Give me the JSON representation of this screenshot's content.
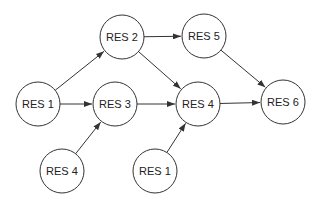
{
  "diagram": {
    "type": "directed-graph",
    "node_radius": 22,
    "colors": {
      "stroke": "#333333",
      "fill": "#ffffff",
      "text": "#222222"
    },
    "nodes": [
      {
        "id": "n_res1_left",
        "label": "RES 1",
        "x": 38,
        "y": 104
      },
      {
        "id": "n_res2",
        "label": "RES 2",
        "x": 122,
        "y": 37
      },
      {
        "id": "n_res3",
        "label": "RES 3",
        "x": 115,
        "y": 104
      },
      {
        "id": "n_res4_mid",
        "label": "RES 4",
        "x": 198,
        "y": 104
      },
      {
        "id": "n_res5",
        "label": "RES 5",
        "x": 204,
        "y": 36
      },
      {
        "id": "n_res6",
        "label": "RES 6",
        "x": 283,
        "y": 102
      },
      {
        "id": "n_res4_bottom",
        "label": "RES 4",
        "x": 62,
        "y": 171
      },
      {
        "id": "n_res1_bottom",
        "label": "RES 1",
        "x": 155,
        "y": 171
      }
    ],
    "edges": [
      {
        "from": "n_res1_left",
        "to": "n_res2"
      },
      {
        "from": "n_res1_left",
        "to": "n_res3"
      },
      {
        "from": "n_res2",
        "to": "n_res5"
      },
      {
        "from": "n_res2",
        "to": "n_res4_mid"
      },
      {
        "from": "n_res3",
        "to": "n_res4_mid"
      },
      {
        "from": "n_res4_bottom",
        "to": "n_res3"
      },
      {
        "from": "n_res1_bottom",
        "to": "n_res4_mid"
      },
      {
        "from": "n_res4_mid",
        "to": "n_res6"
      },
      {
        "from": "n_res5",
        "to": "n_res6"
      }
    ]
  }
}
